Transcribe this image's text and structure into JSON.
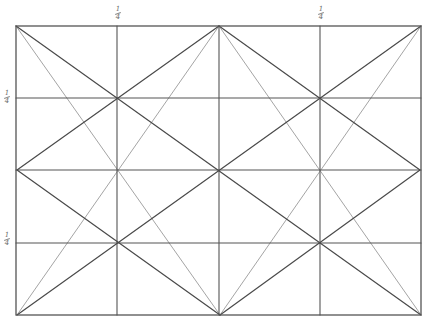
{
  "diagram": {
    "title": "",
    "type": "rectangle-armature-grid",
    "stroke_colors": {
      "dark": "#4a4a4a",
      "light": "#9a9a9a",
      "frame": "#555555"
    },
    "frame": {
      "x1": 16,
      "y1": 26,
      "x2": 421,
      "y2": 315
    },
    "labels": [
      {
        "id": "top-left-quarter",
        "num": "1",
        "den": "4",
        "x": 113,
        "y": 6
      },
      {
        "id": "top-right-quarter",
        "num": "1",
        "den": "4",
        "x": 316,
        "y": 6
      },
      {
        "id": "left-upper-quarter",
        "num": "1",
        "den": "4",
        "x": 2,
        "y": 90
      },
      {
        "id": "left-lower-quarter",
        "num": "1",
        "den": "4",
        "x": 2,
        "y": 232
      }
    ],
    "grid_lines": {
      "verticals": [
        117,
        219,
        320
      ],
      "horizontals": [
        98,
        170,
        243
      ]
    },
    "dark_lines": [
      {
        "from": [
          16,
          26
        ],
        "to": [
          421,
          315
        ],
        "name": "main-diagonal-tl-br"
      },
      {
        "from": [
          421,
          26
        ],
        "to": [
          17,
          315
        ],
        "name": "main-diagonal-tr-bl"
      },
      {
        "from": [
          219,
          26
        ],
        "to": [
          17,
          170
        ],
        "name": "diamond-top-left"
      },
      {
        "from": [
          17,
          170
        ],
        "to": [
          220,
          315
        ],
        "name": "diamond-bottom-left"
      },
      {
        "from": [
          220,
          315
        ],
        "to": [
          420,
          170
        ],
        "name": "diamond-bottom-right"
      },
      {
        "from": [
          420,
          170
        ],
        "to": [
          219,
          26
        ],
        "name": "diamond-top-right"
      }
    ],
    "light_lines": [
      {
        "from": [
          16,
          26
        ],
        "to": [
          220,
          315
        ],
        "name": "reciprocal-tl-to-bottom-mid"
      },
      {
        "from": [
          17,
          315
        ],
        "to": [
          219,
          26
        ],
        "name": "reciprocal-bl-to-top-mid"
      },
      {
        "from": [
          421,
          26
        ],
        "to": [
          220,
          315
        ],
        "name": "reciprocal-tr-to-bottom-mid"
      },
      {
        "from": [
          421,
          315
        ],
        "to": [
          219,
          26
        ],
        "name": "reciprocal-br-to-top-mid"
      }
    ]
  }
}
